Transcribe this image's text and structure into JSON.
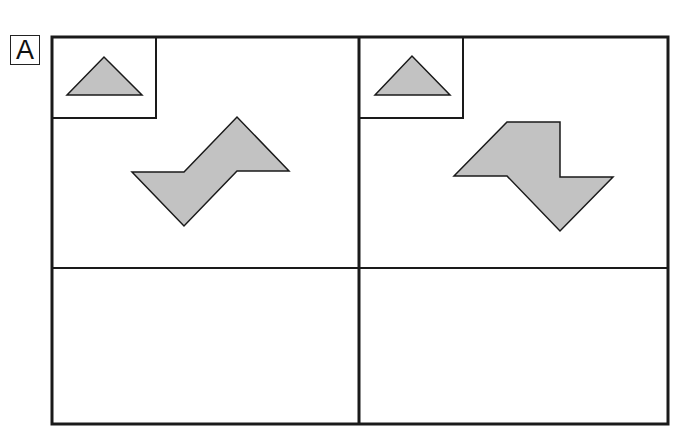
{
  "puzzle": {
    "label": "A",
    "colors": {
      "fill": "#c2c2c2",
      "stroke": "#1a1a1a"
    },
    "panels": [
      {
        "name": "left",
        "shape": "z-shape",
        "example": "triangle"
      },
      {
        "name": "right",
        "shape": "s-shape",
        "example": "triangle"
      }
    ]
  }
}
